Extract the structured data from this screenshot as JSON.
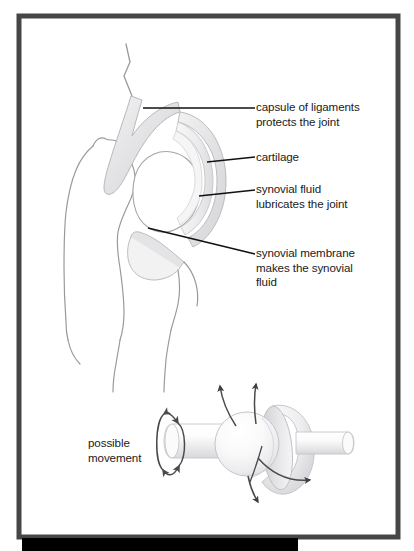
{
  "figure": {
    "type": "anatomical-diagram",
    "frame": {
      "border_color": "#464646",
      "background_color": "#ffffff",
      "shadow_bar_color": "#000000"
    },
    "palette": {
      "outline": "#8a8a8a",
      "bone_fill": "#ffffff",
      "cartilage_fill": "#ececed",
      "capsule_fill": "#e2e2e3",
      "synovial_fill": "#f4f4f5",
      "leader_line": "#111111",
      "text": "#1a1a1a",
      "arrow": "#4a4a4a"
    },
    "labels": [
      {
        "id": "capsule",
        "text": "capsule of ligaments\nprotects the joint",
        "lines": [
          "capsule of ligaments",
          "protects the joint"
        ]
      },
      {
        "id": "cartilage",
        "text": "cartilage",
        "lines": [
          "cartilage"
        ]
      },
      {
        "id": "synovial_fluid",
        "text": "synovial fluid\nlubricates the joint",
        "lines": [
          "synovial fluid",
          "lubricates the joint"
        ]
      },
      {
        "id": "synovial_membrane",
        "text": "synovial membrane\nmakes the synovial\nfluid",
        "lines": [
          "synovial membrane",
          "makes the synovial",
          "fluid"
        ]
      },
      {
        "id": "possible_movement",
        "text": "possible\nmovement",
        "lines": [
          "possible",
          "movement"
        ]
      }
    ],
    "lower_diagram": {
      "name": "ball-and-socket-joint",
      "parts": [
        "left rod",
        "ball",
        "socket cup",
        "right rod"
      ],
      "arrow_count": 6,
      "arrow_meanings": [
        "rotation",
        "rotation",
        "flexion up",
        "flexion up",
        "swing down",
        "swing right"
      ]
    }
  }
}
